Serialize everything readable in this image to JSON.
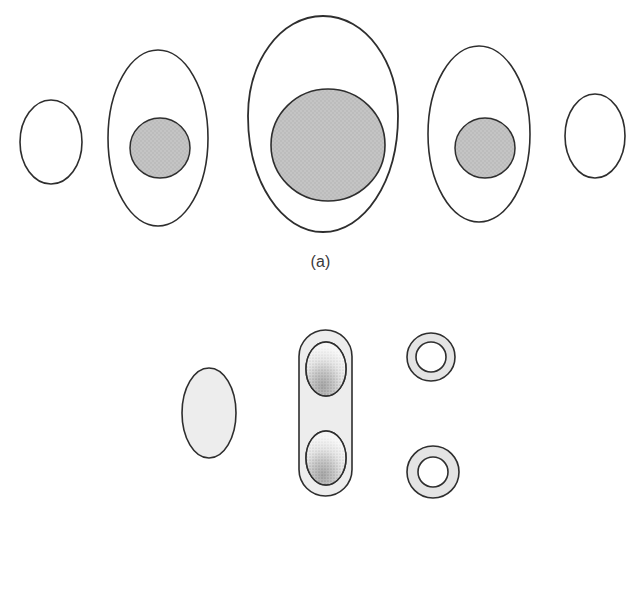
{
  "figure": {
    "background_color": "#ffffff",
    "width": 641,
    "height": 591
  },
  "palette": {
    "outline": "#2e2e2e",
    "nucleus_fill": "#c4c4c4",
    "cell_fill": "#ffffff",
    "light_fill": "#ededed",
    "ring_fill": "#e4e4e4",
    "stipple": "#808080",
    "caption_text": "#3a3a3a"
  },
  "panels": [
    {
      "id": "panel-a",
      "caption": "(a)",
      "description": "Series of five oval cells showing nuclear growth and disappearance",
      "shapes": [
        {
          "name": "cell-stage-1-empty-oval",
          "type": "ellipse",
          "cx": 51,
          "cy": 142,
          "rx": 31,
          "ry": 42,
          "fill": "#ffffff",
          "stroke": "#2e2e2e",
          "stroke_width": 1.6,
          "nucleus": null
        },
        {
          "name": "cell-stage-2-nucleated-oval",
          "type": "ellipse",
          "cx": 158,
          "cy": 138,
          "rx": 50,
          "ry": 88,
          "fill": "#ffffff",
          "stroke": "#2e2e2e",
          "stroke_width": 1.6,
          "nucleus": {
            "cx": 160,
            "cy": 148,
            "rx": 30,
            "ry": 30,
            "fill": "#c4c4c4"
          }
        },
        {
          "name": "cell-stage-3-large-egg",
          "type": "egg",
          "cx": 323,
          "cy": 124,
          "rx": 75,
          "ry": 108,
          "fill": "#ffffff",
          "stroke": "#2e2e2e",
          "stroke_width": 1.8,
          "nucleus": {
            "cx": 328,
            "cy": 145,
            "rx": 57,
            "ry": 56,
            "fill": "#c4c4c4"
          }
        },
        {
          "name": "cell-stage-4-nucleated-oval",
          "type": "ellipse",
          "cx": 479,
          "cy": 134,
          "rx": 51,
          "ry": 88,
          "fill": "#ffffff",
          "stroke": "#2e2e2e",
          "stroke_width": 1.6,
          "nucleus": {
            "cx": 485,
            "cy": 148,
            "rx": 30,
            "ry": 30,
            "fill": "#c4c4c4"
          }
        },
        {
          "name": "cell-stage-5-empty-oval",
          "type": "ellipse",
          "cx": 595,
          "cy": 136,
          "rx": 30,
          "ry": 42,
          "fill": "#ffffff",
          "stroke": "#2e2e2e",
          "stroke_width": 1.6,
          "nucleus": null
        }
      ]
    },
    {
      "id": "panel-b",
      "caption": "(b)",
      "description": "Filled ellipse, capsule with two stippled internal spores, and two ring forms",
      "shapes": [
        {
          "name": "spore-solid-ellipse",
          "type": "ellipse",
          "cx": 209,
          "cy": 413,
          "rx": 27,
          "ry": 45,
          "fill": "#ededed",
          "stroke": "#2e2e2e",
          "stroke_width": 1.6
        },
        {
          "name": "capsule-with-two-spores",
          "type": "capsule",
          "x": 299,
          "y": 330,
          "width": 53,
          "height": 166,
          "fill": "#ededed",
          "stroke": "#2e2e2e",
          "stroke_width": 1.6,
          "inner_spores": [
            {
              "name": "inner-spore-upper",
              "cx": 326,
              "cy": 369,
              "rx": 20,
              "ry": 27,
              "fill": "#f4f4f4",
              "stipple": true
            },
            {
              "name": "inner-spore-lower",
              "cx": 326,
              "cy": 458,
              "rx": 20,
              "ry": 27,
              "fill": "#f4f4f4",
              "stipple": true
            }
          ]
        },
        {
          "name": "ring-form-upper",
          "type": "ring",
          "cx": 431,
          "cy": 357,
          "r_outer": 24,
          "r_inner": 15,
          "fill": "#e4e4e4",
          "stroke": "#2e2e2e",
          "stroke_width": 1.6
        },
        {
          "name": "ring-form-lower",
          "type": "ring",
          "cx": 433,
          "cy": 472,
          "r_outer": 26,
          "r_inner": 15,
          "fill": "#e4e4e4",
          "stroke": "#2e2e2e",
          "stroke_width": 1.6
        }
      ]
    }
  ]
}
